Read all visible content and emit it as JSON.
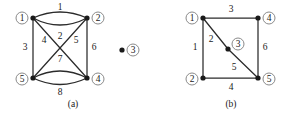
{
  "figure": {
    "background_color": "#ffffff",
    "ink_color": "#1a1a1a",
    "ring_color": "#8a8a8a",
    "width": 291,
    "height": 114
  },
  "panels": [
    {
      "id": "panel-a",
      "caption": "(a)",
      "caption_pos": {
        "x": 73,
        "y": 105
      },
      "vertices": [
        {
          "id": "a-v1",
          "label": "1",
          "dot": {
            "x": 33,
            "y": 18
          },
          "ring": {
            "x": 22,
            "y": 18
          }
        },
        {
          "id": "a-v2",
          "label": "2",
          "dot": {
            "x": 87,
            "y": 18
          },
          "ring": {
            "x": 98,
            "y": 18
          }
        },
        {
          "id": "a-v5",
          "label": "5",
          "dot": {
            "x": 33,
            "y": 78
          },
          "ring": {
            "x": 22,
            "y": 79
          }
        },
        {
          "id": "a-v4",
          "label": "4",
          "dot": {
            "x": 87,
            "y": 78
          },
          "ring": {
            "x": 98,
            "y": 79
          }
        }
      ],
      "edges": [
        {
          "id": "a-e1",
          "label": "1",
          "from": "a-v1",
          "to": "a-v2",
          "kind": "arc-up",
          "path": "M 33 18 Q 60 6 87 18",
          "label_pos": {
            "x": 60,
            "y": 8
          }
        },
        {
          "id": "a-e2",
          "label": "2",
          "from": "a-v1",
          "to": "a-v2",
          "kind": "arc-down",
          "path": "M 33 18 Q 60 32 87 18",
          "label_pos": {
            "x": 60,
            "y": 37
          }
        },
        {
          "id": "a-e3",
          "label": "3",
          "from": "a-v1",
          "to": "a-v5",
          "kind": "straight",
          "path": "M 33 18 L 33 78",
          "label_pos": {
            "x": 25,
            "y": 48
          }
        },
        {
          "id": "a-e4",
          "label": "4",
          "from": "a-v1",
          "to": "a-v4",
          "kind": "straight",
          "path": "M 33 18 L 87 78",
          "label_pos": {
            "x": 44,
            "y": 41
          }
        },
        {
          "id": "a-e5",
          "label": "5",
          "from": "a-v2",
          "to": "a-v5",
          "kind": "straight",
          "path": "M 87 18 L 33 78",
          "label_pos": {
            "x": 76,
            "y": 41
          }
        },
        {
          "id": "a-e6",
          "label": "6",
          "from": "a-v2",
          "to": "a-v4",
          "kind": "straight",
          "path": "M 87 18 L 87 78",
          "label_pos": {
            "x": 94,
            "y": 48
          }
        },
        {
          "id": "a-e7",
          "label": "7",
          "from": "a-v5",
          "to": "a-v4",
          "kind": "arc-up",
          "path": "M 33 78 Q 60 64 87 78",
          "label_pos": {
            "x": 60,
            "y": 60
          }
        },
        {
          "id": "a-e8",
          "label": "8",
          "from": "a-v5",
          "to": "a-v4",
          "kind": "arc-down",
          "path": "M 33 78 Q 60 91 87 78",
          "label_pos": {
            "x": 60,
            "y": 93
          }
        }
      ],
      "isolated_vertices": [
        {
          "id": "a-v3",
          "label": "3",
          "dot": {
            "x": 122,
            "y": 50
          },
          "ring": {
            "x": 133,
            "y": 50
          }
        }
      ]
    },
    {
      "id": "panel-b",
      "caption": "(b)",
      "caption_pos": {
        "x": 231,
        "y": 105
      },
      "vertices": [
        {
          "id": "b-v1",
          "label": "1",
          "dot": {
            "x": 203,
            "y": 18
          },
          "ring": {
            "x": 192,
            "y": 18
          }
        },
        {
          "id": "b-v4",
          "label": "4",
          "dot": {
            "x": 258,
            "y": 18
          },
          "ring": {
            "x": 269,
            "y": 18
          }
        },
        {
          "id": "b-v2",
          "label": "2",
          "dot": {
            "x": 203,
            "y": 78
          },
          "ring": {
            "x": 192,
            "y": 79
          }
        },
        {
          "id": "b-v5",
          "label": "5",
          "dot": {
            "x": 258,
            "y": 78
          },
          "ring": {
            "x": 269,
            "y": 79
          }
        },
        {
          "id": "b-v3",
          "label": "3",
          "dot": {
            "x": 228,
            "y": 49
          },
          "ring": {
            "x": 238,
            "y": 44
          }
        }
      ],
      "edges": [
        {
          "id": "b-e1",
          "label": "1",
          "from": "b-v1",
          "to": "b-v2",
          "kind": "straight",
          "path": "M 203 18 L 203 78",
          "label_pos": {
            "x": 195,
            "y": 48
          }
        },
        {
          "id": "b-e2",
          "label": "2",
          "from": "b-v1",
          "to": "b-v3",
          "kind": "straight",
          "path": "M 203 18 L 228 49",
          "label_pos": {
            "x": 211,
            "y": 40
          }
        },
        {
          "id": "b-e3",
          "label": "3",
          "from": "b-v1",
          "to": "b-v4",
          "kind": "straight",
          "path": "M 203 18 L 258 18",
          "label_pos": {
            "x": 231,
            "y": 10
          }
        },
        {
          "id": "b-e4",
          "label": "4",
          "from": "b-v2",
          "to": "b-v5",
          "kind": "straight",
          "path": "M 203 78 L 258 78",
          "label_pos": {
            "x": 231,
            "y": 88
          }
        },
        {
          "id": "b-e5",
          "label": "5",
          "from": "b-v3",
          "to": "b-v5",
          "kind": "straight",
          "path": "M 228 49 L 258 78",
          "label_pos": {
            "x": 234,
            "y": 68
          }
        },
        {
          "id": "b-e6",
          "label": "6",
          "from": "b-v4",
          "to": "b-v5",
          "kind": "straight",
          "path": "M 258 18 L 258 78",
          "label_pos": {
            "x": 265,
            "y": 48
          }
        }
      ],
      "isolated_vertices": []
    }
  ]
}
